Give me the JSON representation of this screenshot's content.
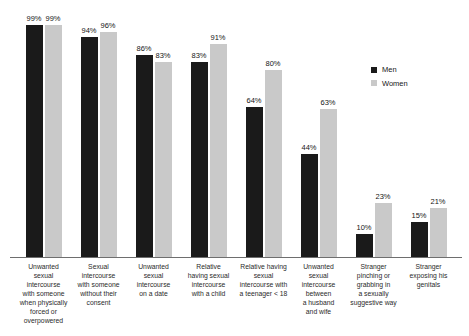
{
  "chart_data": {
    "type": "bar",
    "categories": [
      "Unwanted sexual intercourse with someone when physically forced or overpowered",
      "Sexual intercourse with someone without their consent",
      "Unwanted sexual intercourse on a date",
      "Relative having sexual intercourse with a child",
      "Relative having sexual intercourse with a teenager < 18",
      "Unwanted sexual intercourse between a husband and wife",
      "Stranger pinching or grabbing in a sexually suggestive way",
      "Stranger exposing his genitals"
    ],
    "category_lines": [
      [
        "Unwanted",
        "sexual",
        "intercourse",
        "with someone",
        "when physically",
        "forced or",
        "overpowered"
      ],
      [
        "Sexual",
        "intercourse",
        "with someone",
        "without their",
        "consent"
      ],
      [
        "Unwanted",
        "sexual",
        "intercourse",
        "on a date"
      ],
      [
        "Relative",
        "having sexual",
        "intercourse",
        "with a child"
      ],
      [
        "Relative having",
        "sexual",
        "intercourse with",
        "a teenager < 18"
      ],
      [
        "Unwanted",
        "sexual",
        "intercourse",
        "between",
        "a husband",
        "and wife"
      ],
      [
        "Stranger",
        "pinching or",
        "grabbing in",
        "a sexually",
        "suggestive way"
      ],
      [
        "Stranger",
        "exposing his",
        "genitals"
      ]
    ],
    "series": [
      {
        "name": "Men",
        "values": [
          99,
          94,
          86,
          83,
          64,
          44,
          10,
          15
        ]
      },
      {
        "name": "Women",
        "values": [
          99,
          96,
          83,
          91,
          80,
          63,
          23,
          21
        ]
      }
    ],
    "value_suffix": "%",
    "title": "",
    "xlabel": "",
    "ylabel": "",
    "ylim": [
      0,
      100
    ],
    "grid": false,
    "legend_position": "right-middle",
    "colors": {
      "men": "#1a1a1a",
      "women": "#c9c9c9"
    }
  }
}
